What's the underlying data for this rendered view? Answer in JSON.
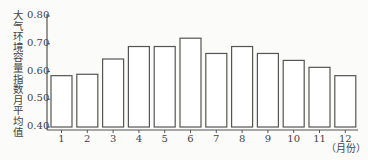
{
  "chart_data": {
    "type": "bar",
    "title": "",
    "xlabel": "（月份）",
    "ylabel": "大气环境容量指数月平均值",
    "categories": [
      "1",
      "2",
      "3",
      "4",
      "5",
      "6",
      "7",
      "8",
      "9",
      "10",
      "11",
      "12"
    ],
    "values": [
      0.585,
      0.59,
      0.645,
      0.69,
      0.69,
      0.72,
      0.665,
      0.69,
      0.665,
      0.64,
      0.615,
      0.585
    ],
    "ylim": [
      0.4,
      0.8
    ],
    "yticks": [
      "0.40",
      "0.50",
      "0.60",
      "0.70",
      "0.80"
    ],
    "grid": false,
    "bar_fill": "#ffffff",
    "bar_stroke": "#555555"
  }
}
